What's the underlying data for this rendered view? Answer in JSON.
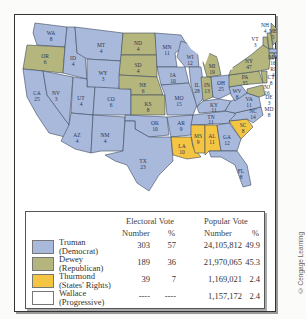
{
  "colors": {
    "truman": "#a9b9dc",
    "dewey": "#b5b67e",
    "thurmond": "#f4c542",
    "wallace": "#ffffff",
    "border": "#3d4a5c",
    "lakes": "#ffffff"
  },
  "states": [
    {
      "abbr": "WA",
      "ev": "8",
      "party": "truman"
    },
    {
      "abbr": "OR",
      "ev": "6",
      "party": "dewey"
    },
    {
      "abbr": "CA",
      "ev": "25",
      "party": "truman"
    },
    {
      "abbr": "ID",
      "ev": "4",
      "party": "truman"
    },
    {
      "abbr": "NV",
      "ev": "3",
      "party": "truman"
    },
    {
      "abbr": "MT",
      "ev": "4",
      "party": "truman"
    },
    {
      "abbr": "WY",
      "ev": "3",
      "party": "truman"
    },
    {
      "abbr": "UT",
      "ev": "4",
      "party": "truman"
    },
    {
      "abbr": "CO",
      "ev": "6",
      "party": "truman"
    },
    {
      "abbr": "AZ",
      "ev": "4",
      "party": "truman"
    },
    {
      "abbr": "NM",
      "ev": "4",
      "party": "truman"
    },
    {
      "abbr": "ND",
      "ev": "4",
      "party": "dewey"
    },
    {
      "abbr": "SD",
      "ev": "4",
      "party": "dewey"
    },
    {
      "abbr": "NE",
      "ev": "6",
      "party": "dewey"
    },
    {
      "abbr": "KS",
      "ev": "8",
      "party": "dewey"
    },
    {
      "abbr": "OK",
      "ev": "10",
      "party": "truman"
    },
    {
      "abbr": "TX",
      "ev": "23",
      "party": "truman"
    },
    {
      "abbr": "MN",
      "ev": "11",
      "party": "truman"
    },
    {
      "abbr": "IA",
      "ev": "10",
      "party": "truman"
    },
    {
      "abbr": "MO",
      "ev": "15",
      "party": "truman"
    },
    {
      "abbr": "AR",
      "ev": "9",
      "party": "truman"
    },
    {
      "abbr": "LA",
      "ev": "10",
      "party": "thurmond"
    },
    {
      "abbr": "WI",
      "ev": "12",
      "party": "truman"
    },
    {
      "abbr": "IL",
      "ev": "28",
      "party": "truman"
    },
    {
      "abbr": "MI",
      "ev": "19",
      "party": "dewey"
    },
    {
      "abbr": "IN",
      "ev": "13",
      "party": "dewey"
    },
    {
      "abbr": "OH",
      "ev": "25",
      "party": "truman"
    },
    {
      "abbr": "KY",
      "ev": "11",
      "party": "truman"
    },
    {
      "abbr": "TN",
      "ev": "11",
      "party": "truman"
    },
    {
      "abbr": "MS",
      "ev": "9",
      "party": "thurmond"
    },
    {
      "abbr": "AL",
      "ev": "11",
      "party": "thurmond"
    },
    {
      "abbr": "GA",
      "ev": "12",
      "party": "truman"
    },
    {
      "abbr": "FL",
      "ev": "8",
      "party": "truman"
    },
    {
      "abbr": "SC",
      "ev": "8",
      "party": "thurmond"
    },
    {
      "abbr": "NC",
      "ev": "14",
      "party": "truman"
    },
    {
      "abbr": "VA",
      "ev": "11",
      "party": "truman"
    },
    {
      "abbr": "WV",
      "ev": "8",
      "party": "truman"
    },
    {
      "abbr": "PA",
      "ev": "35",
      "party": "dewey"
    },
    {
      "abbr": "NY",
      "ev": "47",
      "party": "dewey"
    },
    {
      "abbr": "VT",
      "ev": "3",
      "party": "dewey"
    },
    {
      "abbr": "NH",
      "ev": "4",
      "party": "dewey"
    },
    {
      "abbr": "ME",
      "ev": "5",
      "party": "dewey"
    },
    {
      "abbr": "MA",
      "ev": "16",
      "party": "truman"
    },
    {
      "abbr": "RI",
      "ev": "4",
      "party": "truman"
    },
    {
      "abbr": "CT",
      "ev": "8",
      "party": "dewey"
    },
    {
      "abbr": "NJ",
      "ev": "16",
      "party": "dewey"
    },
    {
      "abbr": "DE",
      "ev": "3",
      "party": "dewey"
    },
    {
      "abbr": "MD",
      "ev": "8",
      "party": "dewey"
    }
  ],
  "table": {
    "group_headers": {
      "electoral": "Electoral Vote",
      "popular": "Popular Vote"
    },
    "sub_headers": {
      "ev_number": "Number",
      "ev_pct": "%",
      "pv_number": "Number",
      "pv_pct": "%"
    },
    "rows": [
      {
        "candidate": "Truman",
        "party": "(Democrat)",
        "ev_number": "303",
        "ev_pct": "57",
        "pv_number": "24,105,812",
        "pv_pct": "49.9"
      },
      {
        "candidate": "Dewey",
        "party": "(Republican)",
        "ev_number": "189",
        "ev_pct": "36",
        "pv_number": "21,970,065",
        "pv_pct": "45.3"
      },
      {
        "candidate": "Thurmond",
        "party": "(States' Rights)",
        "ev_number": "39",
        "ev_pct": "7",
        "pv_number": "1,169,021",
        "pv_pct": "2.4"
      },
      {
        "candidate": "Wallace",
        "party": "(Progressive)",
        "ev_number": "----",
        "ev_pct": "----",
        "pv_number": "1,157,172",
        "pv_pct": "2.4"
      }
    ]
  },
  "credit": "© Cengage Learning"
}
